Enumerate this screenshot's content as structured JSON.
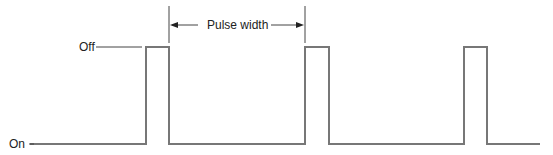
{
  "diagram": {
    "type": "pulse-waveform",
    "labels": {
      "off": "Off",
      "on": "On",
      "pulse_width": "Pulse width"
    },
    "levels": {
      "off_y": 47,
      "on_y": 144
    },
    "pulses": [
      {
        "rise_x": 146,
        "fall_x": 169
      },
      {
        "rise_x": 305,
        "fall_x": 329
      },
      {
        "rise_x": 464,
        "fall_x": 487
      }
    ],
    "pulse_width_span": {
      "from_x": 169,
      "to_x": 305
    },
    "colors": {
      "waveform": "#777777",
      "text": "#222222",
      "lines": "#444444"
    }
  }
}
